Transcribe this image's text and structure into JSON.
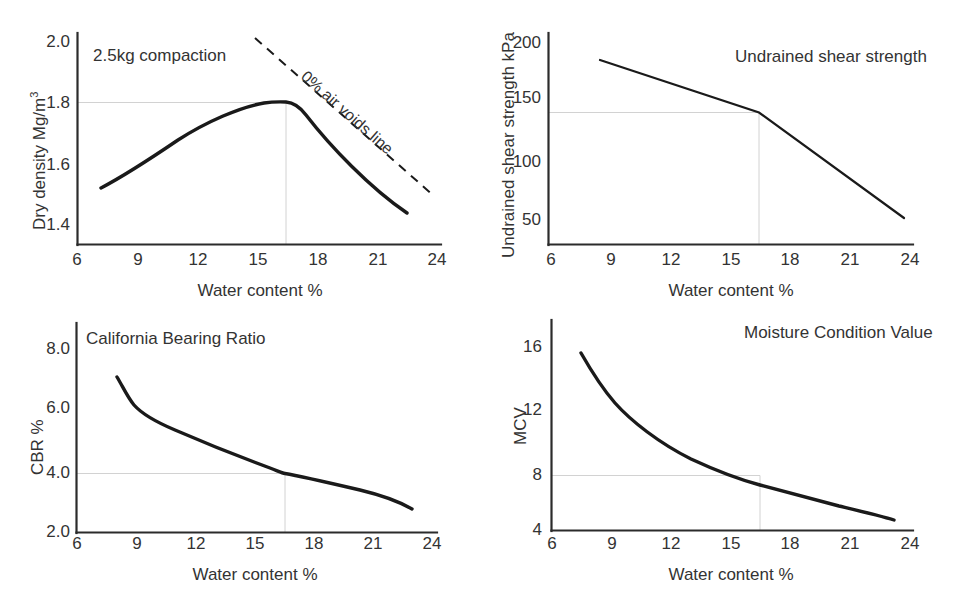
{
  "figure": {
    "background": "#ffffff",
    "line_color": "#1a1a1a",
    "reference_line_color": "#cfcfcf"
  },
  "shared": {
    "xlabel": "Water content %",
    "xticks": [
      "6",
      "9",
      "12",
      "15",
      "18",
      "21",
      "24"
    ],
    "optimum_water_content": 16.5
  },
  "chart_data": [
    {
      "id": "dry-density",
      "type": "line",
      "title": "2.5kg compaction",
      "xlabel": "Water content %",
      "ylabel": "Dry density Mg/m3",
      "ylabel_display": "Dry density Mg/m",
      "ylabel_superscript": "3",
      "xlim": [
        6,
        24
      ],
      "ylim": [
        1.3,
        2.0
      ],
      "xticks": [
        6,
        9,
        12,
        15,
        18,
        21,
        24
      ],
      "yticks": [
        1.4,
        1.6,
        1.8,
        2.0
      ],
      "ytick_labels": [
        "1.4",
        "1.6",
        "1.8",
        "2.0"
      ],
      "grid": false,
      "legend": "none",
      "annotation": "0% air voids line",
      "reference_lines": {
        "x": 16.5,
        "y": 1.8
      },
      "series": [
        {
          "name": "2.5kg compaction curve",
          "style": "solid",
          "x": [
            7.2,
            8.5,
            10.0,
            11.5,
            13.0,
            14.5,
            15.5,
            16.5,
            17.3,
            18.5,
            20.0,
            21.5,
            23.6
          ],
          "y": [
            1.52,
            1.565,
            1.62,
            1.672,
            1.718,
            1.76,
            1.784,
            1.8,
            1.79,
            1.742,
            1.665,
            1.582,
            1.445
          ]
        },
        {
          "name": "0% air voids line",
          "style": "dashed",
          "x": [
            14.8,
            23.5
          ],
          "y": [
            1.966,
            1.5
          ]
        }
      ]
    },
    {
      "id": "undrained-shear-strength",
      "type": "line",
      "title": "Undrained shear strength",
      "xlabel": "Water content %",
      "ylabel": "Undrained shear strength kPa",
      "xlim": [
        6,
        24
      ],
      "ylim": [
        36,
        206
      ],
      "xticks": [
        6,
        9,
        12,
        15,
        18,
        21,
        24
      ],
      "yticks": [
        50,
        100,
        150,
        200
      ],
      "ytick_labels": [
        "50",
        "100",
        "150",
        "200"
      ],
      "grid": false,
      "legend": "none",
      "reference_lines": {
        "x": 16.5,
        "y": 112
      },
      "series": [
        {
          "name": "Undrained shear strength",
          "style": "solid",
          "x": [
            8.6,
            16.5,
            23.7
          ],
          "y": [
            182,
            112,
            57
          ]
        }
      ]
    },
    {
      "id": "california-bearing-ratio",
      "type": "line",
      "title": "California Bearing Ratio",
      "xlabel": "Water content %",
      "ylabel": "CBR %",
      "xlim": [
        6,
        24
      ],
      "ylim": [
        2.0,
        8.6
      ],
      "xticks": [
        6,
        9,
        12,
        15,
        18,
        21,
        24
      ],
      "yticks": [
        2.0,
        4.0,
        6.0,
        8.0
      ],
      "ytick_labels": [
        "2.0",
        "4.0",
        "6.0",
        "8.0"
      ],
      "grid": false,
      "legend": "none",
      "reference_lines": {
        "x": 16.5,
        "y": 4.35
      },
      "series": [
        {
          "name": "CBR curve",
          "style": "solid",
          "x": [
            8.0,
            8.4,
            9.0,
            10.0,
            11.5,
            13.0,
            14.5,
            16.0,
            16.5,
            18.0,
            19.5,
            21.0,
            22.3,
            23.5
          ],
          "y": [
            6.8,
            6.3,
            5.95,
            5.62,
            5.28,
            5.0,
            4.75,
            4.46,
            4.35,
            4.22,
            4.08,
            3.92,
            3.75,
            3.55
          ]
        }
      ]
    },
    {
      "id": "moisture-condition-value",
      "type": "line",
      "title": "Moisture Condition Value",
      "xlabel": "Water content %",
      "ylabel": "MCV",
      "xlim": [
        6,
        24
      ],
      "ylim": [
        4,
        17
      ],
      "xticks": [
        6,
        9,
        12,
        15,
        18,
        21,
        24
      ],
      "yticks": [
        4,
        8,
        12,
        16
      ],
      "ytick_labels": [
        "4",
        "8",
        "12",
        "16"
      ],
      "grid": false,
      "legend": "none",
      "reference_lines": {
        "x": 16.5,
        "y": 8.4
      },
      "series": [
        {
          "name": "MCV curve",
          "style": "solid",
          "x": [
            7.5,
            8.0,
            8.8,
            10.0,
            11.5,
            13.0,
            14.5,
            16.0,
            16.5,
            18.0,
            19.5,
            21.0,
            22.0,
            23.0
          ],
          "y": [
            15.2,
            14.1,
            12.9,
            11.7,
            10.75,
            10.0,
            9.35,
            8.6,
            8.4,
            7.8,
            7.25,
            6.7,
            6.3,
            5.85
          ]
        }
      ]
    }
  ]
}
